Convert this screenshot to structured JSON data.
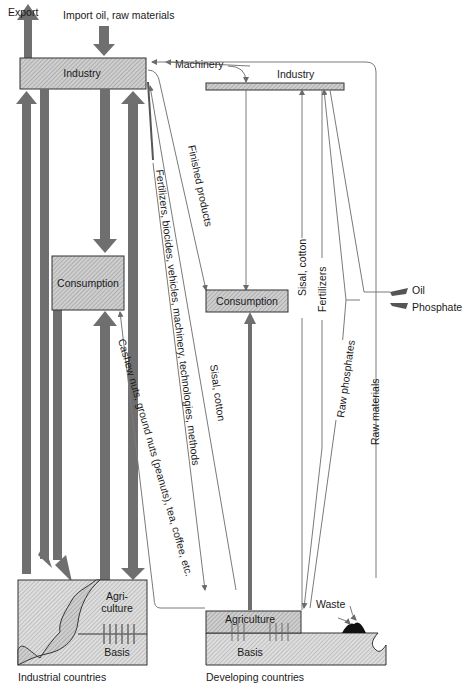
{
  "diagram": {
    "colors": {
      "box_fill": "#c8c8c8",
      "thick_arrow": "#6f6f6f",
      "thin_line": "#7a7a7a",
      "text": "#1a1a1a",
      "waste": "#111111"
    },
    "top_labels": {
      "export": "Export",
      "import": "Import oil, raw materials"
    },
    "industrial": {
      "caption": "Industrial countries",
      "industry": "Industry",
      "consumption": "Consumption",
      "agriculture_line1": "Agri-",
      "agriculture_line2": "culture",
      "basis": "Basis"
    },
    "developing": {
      "caption": "Developing countries",
      "industry": "Industry",
      "consumption": "Consumption",
      "agriculture": "Agriculture",
      "basis": "Basis",
      "waste": "Waste"
    },
    "flows": {
      "machinery": "Machinery",
      "finished_products": "Finished products",
      "fertilizers_etc": "Fertilizers, biocides, vehicles, machinery, technologies, methods",
      "cashew": "Cashew nuts, ground nuts (peanuts), tea, coffee, etc.",
      "sisal_cotton_left": "Sisal, cotton",
      "sisal_cotton_right": "Sisal, cotton",
      "fertilizers": "Fertilizers",
      "raw_phosphates": "Raw phosphates",
      "raw_materials": "Raw materials",
      "oil": "Oil",
      "phosphate": "Phosphate"
    }
  }
}
